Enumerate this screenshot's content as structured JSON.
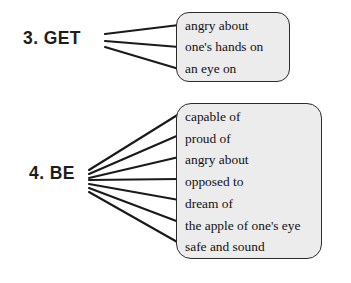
{
  "diagram": {
    "type": "grammar-collocation-branching-diagram",
    "colors": {
      "box_fill": "#ececed",
      "box_border": "#2b2b2b",
      "text": "#111111",
      "label_text": "#1d1d1d",
      "connector": "#1a1a1a",
      "page_background": "#ffffff"
    },
    "groups": [
      {
        "id": "get",
        "label": "3. GET",
        "number": "3.",
        "verb": "GET",
        "items": [
          "angry about",
          "one's hands on",
          "an eye on"
        ]
      },
      {
        "id": "be",
        "label": "4. BE",
        "number": "4.",
        "verb": "BE",
        "items": [
          "capable of",
          "proud of",
          "angry about",
          "opposed to",
          "dream of",
          "the apple of one's eye",
          "safe and sound"
        ]
      }
    ]
  }
}
